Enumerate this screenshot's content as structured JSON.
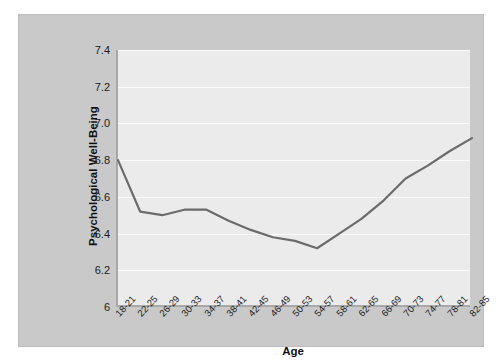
{
  "chart_data": {
    "type": "line",
    "title": "",
    "xlabel": "Age",
    "ylabel": "Psychological Well-Being",
    "categories": [
      "18-21",
      "22-25",
      "26-29",
      "30-33",
      "34-37",
      "38-41",
      "42-45",
      "46-49",
      "50-53",
      "54-57",
      "58-61",
      "62-65",
      "66-69",
      "70-73",
      "74-77",
      "78-81",
      "82-85"
    ],
    "values": [
      6.8,
      6.52,
      6.5,
      6.53,
      6.53,
      6.47,
      6.42,
      6.38,
      6.36,
      6.32,
      6.4,
      6.48,
      6.58,
      6.7,
      6.77,
      6.85,
      6.92
    ],
    "series": [
      {
        "name": "Psychological Well-Being",
        "values": [
          6.8,
          6.52,
          6.5,
          6.53,
          6.53,
          6.47,
          6.42,
          6.38,
          6.36,
          6.32,
          6.4,
          6.48,
          6.58,
          6.7,
          6.77,
          6.85,
          6.92
        ]
      }
    ],
    "ylim": [
      6.0,
      7.4
    ],
    "yticks": [
      6.0,
      6.2,
      6.4,
      6.6,
      6.8,
      7.0,
      7.2,
      7.4
    ],
    "ytick_labels": [
      "6",
      "6.2",
      "6.4",
      "6.6",
      "6.8",
      "7.0",
      "7.2",
      "7.4"
    ],
    "grid": true,
    "grid_axis": "y",
    "legend": false,
    "line_color": "#6b6b6b",
    "plot_background": "#ebebeb",
    "figure_background": "#c9c9c9",
    "gridline_color": "#fbfbfb",
    "axis_color": "#a8a8a8"
  }
}
